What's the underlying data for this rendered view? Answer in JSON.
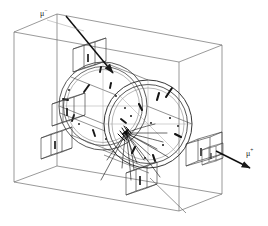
{
  "figure": {
    "kind": "particle-detector-event-display",
    "width": 268,
    "height": 226,
    "background_color": "#ffffff",
    "line_color": "#2b2b2b",
    "faint_line_color": "#8a8a8a",
    "track_color": "#1a1a1a"
  },
  "annotations": {
    "incoming_particle": {
      "symbol": "μ",
      "charge": "−",
      "label_x": 40,
      "label_y": 10
    },
    "outgoing_particle": {
      "symbol": "μ",
      "charge": "+",
      "label_x": 246,
      "label_y": 150
    }
  },
  "outer_volume": {
    "name": "detector-bounding-box",
    "front_face": [
      [
        14,
        32
      ],
      [
        14,
        182
      ],
      [
        179,
        211
      ],
      [
        179,
        62
      ]
    ],
    "back_face": [
      [
        57,
        14
      ],
      [
        57,
        166
      ],
      [
        222,
        194
      ],
      [
        222,
        45
      ]
    ],
    "visible_corners": 8
  },
  "barrel": {
    "name": "cylindrical-barrel-detector",
    "near_ring": {
      "cx": 148,
      "cy": 124,
      "rx": 44,
      "ry": 44,
      "inner_scale": 0.9
    },
    "far_ring": {
      "cx": 103,
      "cy": 106,
      "rx": 44,
      "ry": 44,
      "inner_scale": 0.9
    },
    "axis_tilt_deg": -11
  },
  "modules": [
    {
      "name": "module-top",
      "x": 73,
      "y": 42,
      "w": 30,
      "h": 30,
      "depth": 11,
      "tag": "T"
    },
    {
      "name": "module-left",
      "x": 52,
      "y": 97,
      "w": 30,
      "h": 29,
      "depth": 11,
      "tag": "L"
    },
    {
      "name": "module-lower-left",
      "x": 41,
      "y": 131,
      "w": 29,
      "h": 28,
      "depth": 10,
      "tag": "B"
    },
    {
      "name": "module-bottom",
      "x": 126,
      "y": 166,
      "w": 29,
      "h": 29,
      "depth": 10,
      "tag": "D"
    },
    {
      "name": "module-right",
      "x": 186,
      "y": 137,
      "w": 31,
      "h": 29,
      "depth": 12,
      "tag": "R"
    },
    {
      "name": "module-right-small",
      "x": 202,
      "y": 146,
      "w": 19,
      "h": 19,
      "depth": 8,
      "tag": "S"
    }
  ],
  "tracks": {
    "vertex": {
      "x": 126,
      "y": 133
    },
    "count": 14,
    "hit_markers": 17
  },
  "beam": {
    "incoming_arrow": {
      "from": [
        66,
        16
      ],
      "to": [
        114,
        74
      ]
    },
    "outgoing_arrow": {
      "from": [
        216,
        151
      ],
      "to": [
        252,
        169
      ]
    }
  }
}
